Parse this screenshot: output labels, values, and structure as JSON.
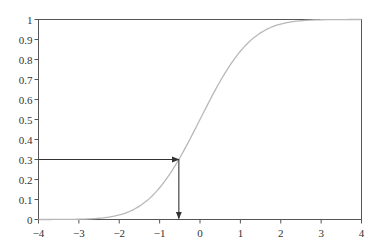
{
  "chart_data": {
    "type": "line",
    "title": "",
    "xlabel": "",
    "ylabel": "",
    "xlim": [
      -4,
      4
    ],
    "ylim": [
      0,
      1
    ],
    "grid": false,
    "legend": null,
    "x_ticks": [
      "-4",
      "-3",
      "-2",
      "-1",
      "0",
      "1",
      "2",
      "3",
      "4"
    ],
    "y_ticks": [
      "0",
      "0.1",
      "0.2",
      "0.3",
      "0.4",
      "0.5",
      "0.6",
      "0.7",
      "0.8",
      "0.9",
      "1"
    ],
    "series": [
      {
        "name": "standard normal CDF",
        "color": "#b8b8b8",
        "x": [
          -4,
          -3.5,
          -3,
          -2.5,
          -2,
          -1.5,
          -1,
          -0.75,
          -0.524,
          -0.25,
          0,
          0.25,
          0.5,
          0.75,
          1,
          1.5,
          2,
          2.5,
          3,
          3.5,
          4
        ],
        "y": [
          0.0,
          0.0002,
          0.0013,
          0.0062,
          0.0228,
          0.0668,
          0.1587,
          0.2266,
          0.3,
          0.4013,
          0.5,
          0.5987,
          0.6915,
          0.7734,
          0.8413,
          0.9332,
          0.9772,
          0.9938,
          0.9987,
          0.9998,
          1.0
        ]
      }
    ],
    "annotations": [
      {
        "type": "arrow",
        "from": [
          -4,
          0.3
        ],
        "to": [
          -0.524,
          0.3
        ],
        "color": "#333333"
      },
      {
        "type": "arrow",
        "from": [
          -0.524,
          0.3
        ],
        "to": [
          -0.524,
          0
        ],
        "color": "#333333"
      }
    ]
  }
}
